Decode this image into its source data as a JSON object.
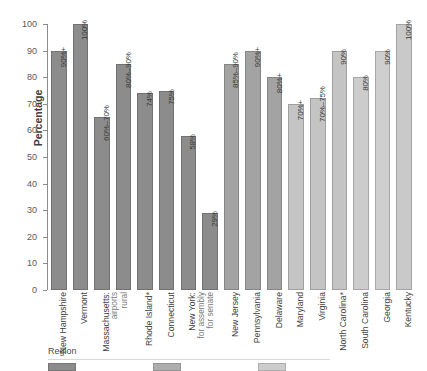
{
  "chart_data": {
    "type": "bar",
    "title": "",
    "xlabel": "",
    "ylabel": "Percentage",
    "ylim": [
      0,
      100
    ],
    "yticks": [
      0,
      10,
      20,
      30,
      40,
      50,
      60,
      70,
      80,
      90,
      100
    ],
    "grid": false,
    "legend_position": "bottom",
    "legend_title": "Region",
    "legend_entries": [
      {
        "label": "",
        "color": "#8c8c8c"
      },
      {
        "label": "",
        "color": "#adadad"
      },
      {
        "label": "",
        "color": "#cccccc"
      }
    ],
    "categories": [
      "New Hampshire",
      "Vermont",
      "Massachusetts: airports",
      "rural",
      "Rhode Island*",
      "Connecticut",
      "New York: for assembly",
      "for senate",
      "New Jersey",
      "Pennsylvania",
      "Delaware",
      "Maryland",
      "Virginia",
      "North Carolina*",
      "South Carolina",
      "Georgia",
      "Kentucky"
    ],
    "values": [
      90,
      100,
      65,
      85,
      74,
      75,
      58,
      29,
      85,
      90,
      80,
      70,
      72,
      90,
      80,
      90,
      100
    ],
    "data_labels": [
      "90%+",
      "100%",
      "60%–70%",
      "80%–90%",
      "74%",
      "75%",
      "58%",
      "29%",
      "85%–90%",
      "90%+",
      "80%+",
      "70%+",
      "70%–75%",
      "90%",
      "80%",
      "90%",
      "100%"
    ],
    "bar_colors": [
      "#8c8c8c",
      "#8c8c8c",
      "#8c8c8c",
      "#8c8c8c",
      "#8c8c8c",
      "#8c8c8c",
      "#8c8c8c",
      "#8c8c8c",
      "#a3a3a3",
      "#a3a3a3",
      "#a3a3a3",
      "#c4c4c4",
      "#c4c4c4",
      "#c4c4c4",
      "#cccccc",
      "#cfcfcf",
      "#c9c9c9"
    ],
    "tick_labels": [
      [
        "New Hampshire"
      ],
      [
        "Vermont"
      ],
      [
        "Massachusetts:",
        "airports",
        "rural"
      ],
      [
        ""
      ],
      [
        "Rhode Island*"
      ],
      [
        "Connecticut"
      ],
      [
        "New York:",
        "for assembly",
        "for senate"
      ],
      [
        ""
      ],
      [
        "New Jersey"
      ],
      [
        "Pennsylvania"
      ],
      [
        "Delaware"
      ],
      [
        "Maryland"
      ],
      [
        "Virginia"
      ],
      [
        "North Carolina*"
      ],
      [
        "South Carolina"
      ],
      [
        "Georgia"
      ],
      [
        "Kentucky"
      ]
    ]
  }
}
